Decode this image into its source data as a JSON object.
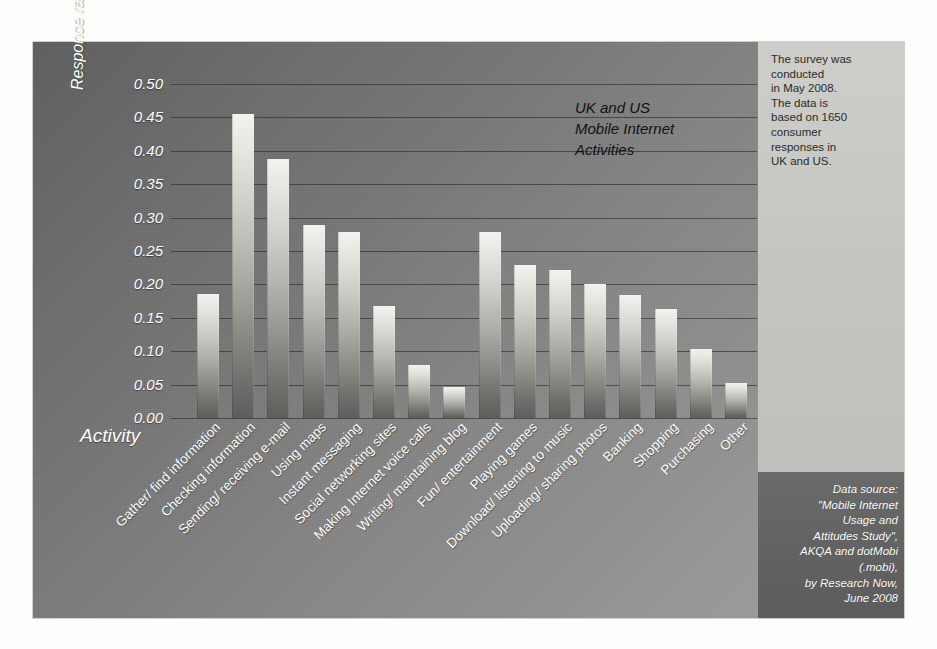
{
  "figure": {
    "chart_title": "UK and US\nMobile Internet\nActivities",
    "survey_note": "The survey was\nconducted\nin May 2008.\nThe data is\nbased on 1650\nconsumer\nresponses in\nUK and US.",
    "source_note": "Data source:\n\"Mobile Internet\nUsage and\nAttitudes Study\",\nAKQA and dotMobi\n(.mobi),\nby Research Now,\nJune 2008",
    "colors": {
      "panel_dark": "#5f5f5f",
      "panel_light": "#9c9c9c",
      "sidebar": "#c6c6c2",
      "source_block": "#636363",
      "bar_top": "#f2f2ee",
      "bar_bottom": "#5e5e5a",
      "gridline": "#282828",
      "axis_text": "#ffffff",
      "title_text": "#111111"
    }
  },
  "chart_data": {
    "type": "bar",
    "title": "UK and US Mobile Internet Activities",
    "xlabel": "Activity",
    "ylabel": "Responce ratio",
    "ylabel_sub": "scale =[0..1]",
    "ylim": [
      0.0,
      0.5
    ],
    "grid": true,
    "legend": "none",
    "ytick_labels": [
      "0.50",
      "0.45",
      "0.40",
      "0.35",
      "0.30",
      "0.25",
      "0.20",
      "0.15",
      "0.10",
      "0.05",
      "0.00"
    ],
    "ytick_values": [
      0.5,
      0.45,
      0.4,
      0.35,
      0.3,
      0.25,
      0.2,
      0.15,
      0.1,
      0.05,
      0.0
    ],
    "categories": [
      "Gather/ find information",
      "Checking information",
      "Sending/ receiving e-mail",
      "Using maps",
      "Instant messaging",
      "Social networking sites",
      "Making Internet voice calls",
      "Writing/ maintaining blog",
      "Fun/ entertainment",
      "Playing games",
      "Download/ listening to music",
      "Uploading/ sharing photos",
      "Banking",
      "Shopping",
      "Purchasing",
      "Other"
    ],
    "values": [
      0.185,
      0.455,
      0.388,
      0.289,
      0.278,
      0.168,
      0.079,
      0.047,
      0.278,
      0.229,
      0.221,
      0.201,
      0.184,
      0.163,
      0.104,
      0.052
    ]
  }
}
